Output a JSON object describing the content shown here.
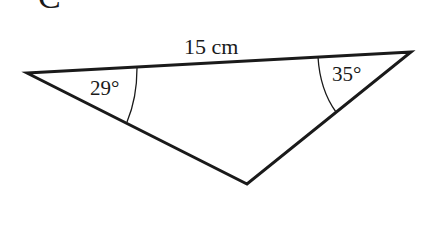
{
  "figure": {
    "letter": "C",
    "shape": "triangle",
    "stroke_color": "#1a1a1a",
    "background": "#ffffff"
  },
  "triangle": {
    "vertices": {
      "left": [
        27,
        73
      ],
      "right": [
        411,
        52
      ],
      "bottom": [
        247,
        184
      ]
    },
    "side_label": "15 cm",
    "angles": [
      {
        "vertex": "left",
        "label": "29°"
      },
      {
        "vertex": "right",
        "label": "35°"
      }
    ]
  }
}
